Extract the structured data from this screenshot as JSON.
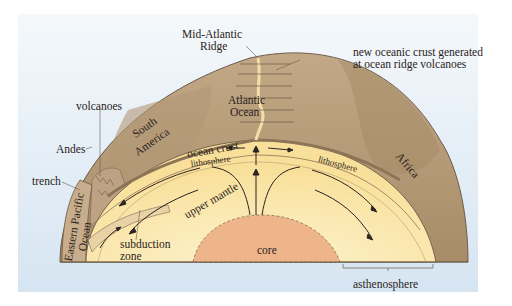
{
  "diagram": {
    "type": "cross-section",
    "colors": {
      "background_sky": "#dfeaf4",
      "crust": "#b59a78",
      "crust_dark": "#9c8160",
      "mantle": "#fbe6a8",
      "mantle_light": "#fdf1c8",
      "core": "#efb58a",
      "outline": "#6b5a48",
      "arrow": "#2a2320"
    },
    "labels": {
      "mid_atlantic_ridge_1": "Mid-Atlantic",
      "mid_atlantic_ridge_2": "Ridge",
      "new_crust_1": "new oceanic crust generated",
      "new_crust_2": "at ocean ridge volcanoes",
      "volcanoes": "volcanoes",
      "andes": "Andes",
      "trench": "trench",
      "eastern_pacific_1": "Eastern Pacific",
      "eastern_pacific_2": "Ocean",
      "south_america_1": "South",
      "south_america_2": "America",
      "atlantic_1": "Atlantic",
      "atlantic_2": "Ocean",
      "ocean_crust": "ocean crust",
      "lithosphere_left": "lithosphere",
      "lithosphere_right": "lithosphere",
      "africa": "Africa",
      "upper_mantle": "upper mantle",
      "subduction_1": "subduction",
      "subduction_2": "zone",
      "core": "core",
      "asthenosphere": "asthenosphere"
    }
  }
}
